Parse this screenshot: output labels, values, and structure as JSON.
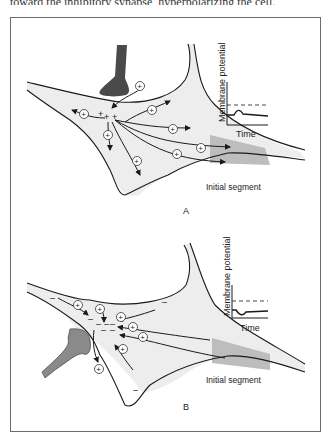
{
  "caption_fragment": "toward the inhibitory synapse, hyperpolarizing the cell.",
  "colors": {
    "cell_fill": "#ededed",
    "initial_segment_fill": "#bdbdbd",
    "excitatory_terminal": "#4a4a4a",
    "inhibitory_terminal": "#8a8a8a",
    "outline": "#1a1a1a"
  },
  "panels": [
    {
      "id": "A",
      "label": "A",
      "synapse_type": "excitatory",
      "inset": {
        "y_axis_label": "Membrane potential",
        "x_axis_label": "Time",
        "trace": "depolarizing bump"
      },
      "initial_segment_label": "Initial segment",
      "ion_symbol": "+",
      "local_charge": "+ + +"
    },
    {
      "id": "B",
      "label": "B",
      "synapse_type": "inhibitory",
      "inset": {
        "y_axis_label": "Membrane potential",
        "x_axis_label": "Time",
        "trace": "hyperpolarizing dip"
      },
      "initial_segment_label": "Initial segment",
      "ion_symbol": "+",
      "local_charge": "– – –"
    }
  ]
}
